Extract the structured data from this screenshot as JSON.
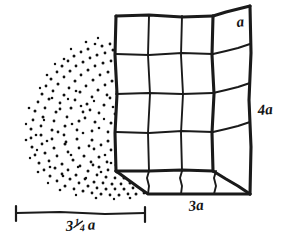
{
  "figure": {
    "type": "hand-drawn-geometry-diagram",
    "background_color": "#ffffff",
    "ink_color": "#1a1a1a",
    "labels": {
      "depth_label": "a",
      "height_label": "4a",
      "width_label": "3a",
      "pile_width_whole": "3",
      "pile_width_numerator": "1",
      "pile_width_denominator": "4",
      "pile_width_unit": "a",
      "pile_width_full": "3 1/4 a"
    },
    "box": {
      "name": "rectangular-box",
      "width_units": 3,
      "height_units": 4,
      "depth_units": 1,
      "front_face_columns": 3,
      "front_face_rows": 4,
      "bottom_face_divisions": 3,
      "right_face_divisions": 4,
      "unit_cube_label": "a"
    },
    "pile": {
      "name": "stippled-pile",
      "style": "stipple-dots",
      "dot_count_approx": 300,
      "description": "mound of granular material drawn with dots"
    },
    "dimension": {
      "name": "pile-width-dimension",
      "style": "line-with-end-ticks",
      "label": "3 1/4 a"
    }
  }
}
